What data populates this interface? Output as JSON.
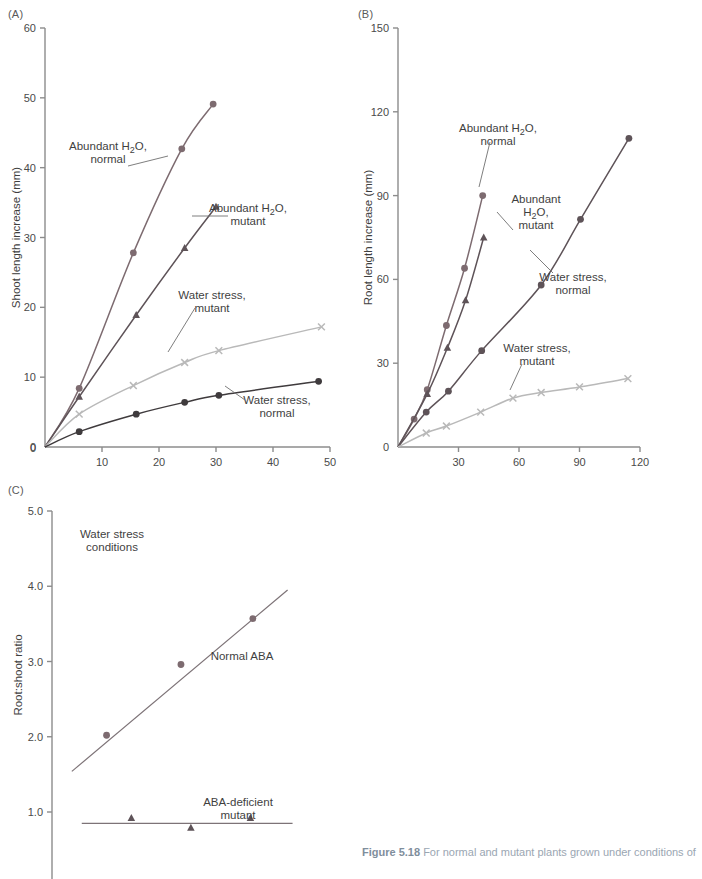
{
  "figure": {
    "caption_label": "Figure 5.18",
    "caption_text": "For normal and mutant plants grown under conditions of"
  },
  "panels": {
    "a": {
      "letter": "(A)",
      "xlabel": "Hours after transplanting",
      "ylabel": "Shoot length increase (mm)",
      "xticks": [
        "0",
        "10",
        "20",
        "30",
        "40",
        "50"
      ],
      "yticks": [
        "0",
        "10",
        "20",
        "30",
        "40",
        "50",
        "60"
      ],
      "labels": {
        "abundant_normal": [
          "Abundant H₂O,",
          "normal"
        ],
        "abundant_mutant": [
          "Abundant H₂O,",
          "mutant"
        ],
        "stress_mutant": [
          "Water stress,",
          "mutant"
        ],
        "stress_normal": [
          "Water stress,",
          "normal"
        ]
      }
    },
    "b": {
      "letter": "(B)",
      "xlabel": "Hours after transplanting",
      "ylabel": "Root length increase (mm)",
      "xticks": [
        "0",
        "30",
        "60",
        "90",
        "120"
      ],
      "yticks": [
        "0",
        "30",
        "60",
        "90",
        "120",
        "150"
      ],
      "labels": {
        "abundant_normal": [
          "Abundant H₂O,",
          "normal"
        ],
        "abundant_mutant": [
          "Abundant",
          "H₂O,",
          "mutant"
        ],
        "stress_normal": [
          "Water stress,",
          "normal"
        ],
        "stress_mutant": [
          "Water stress,",
          "mutant"
        ]
      }
    },
    "c": {
      "letter": "(C)",
      "ylabel": "Root:shoot ratio",
      "yticks": [
        "1.0",
        "2.0",
        "3.0",
        "4.0",
        "5.0"
      ],
      "labels": {
        "conditions": [
          "Water stress",
          "conditions"
        ],
        "normal_aba": "Normal ABA",
        "aba_deficient": [
          "ABA-deficient",
          "mutant"
        ]
      }
    }
  },
  "colors": {
    "axis": "#8c8c8c",
    "text": "#3f3f3f",
    "abundant_normal": "#7d6b70",
    "abundant_mutant": "#5e5358",
    "stress_normal": "#3f3b3d",
    "stress_mutant": "#b9b9b9",
    "panel_c_line": "#7d7377",
    "caption": "#9aa6b2"
  },
  "chart_data": [
    {
      "id": "panel-a",
      "type": "line",
      "title": "(A)",
      "xlabel": "Hours after transplanting",
      "ylabel": "Shoot length increase (mm)",
      "xlim": [
        0,
        50
      ],
      "ylim": [
        0,
        60
      ],
      "xticks": [
        0,
        10,
        20,
        30,
        40,
        50
      ],
      "yticks": [
        0,
        10,
        20,
        30,
        40,
        50,
        60
      ],
      "grid": false,
      "legend": "inline-annotations",
      "series": [
        {
          "name": "Abundant H2O, normal",
          "marker": "circle",
          "color": "#7d6b70",
          "x": [
            0,
            6,
            15.5,
            24,
            29.5
          ],
          "y": [
            0,
            8.4,
            27.8,
            42.7,
            49.1
          ]
        },
        {
          "name": "Abundant H2O, mutant",
          "marker": "triangle",
          "color": "#5e5358",
          "x": [
            0,
            6,
            16,
            24.5,
            30
          ],
          "y": [
            0,
            7.2,
            18.9,
            28.5,
            34.4
          ]
        },
        {
          "name": "Water stress, mutant",
          "marker": "cross",
          "color": "#b9b9b9",
          "x": [
            0,
            6,
            15.5,
            24.5,
            30.5,
            48.5
          ],
          "y": [
            0,
            4.7,
            8.8,
            12.1,
            13.8,
            17.2
          ]
        },
        {
          "name": "Water stress, normal",
          "marker": "circle",
          "color": "#3f3b3d",
          "x": [
            0,
            6,
            16,
            24.5,
            30.5,
            48
          ],
          "y": [
            0,
            2.2,
            4.7,
            6.4,
            7.4,
            9.4
          ]
        }
      ]
    },
    {
      "id": "panel-b",
      "type": "line",
      "title": "(B)",
      "xlabel": "Hours after transplanting",
      "ylabel": "Root length increase (mm)",
      "xlim": [
        0,
        120
      ],
      "ylim": [
        0,
        150
      ],
      "xticks": [
        0,
        30,
        60,
        90,
        120
      ],
      "yticks": [
        0,
        30,
        60,
        90,
        120,
        150
      ],
      "grid": false,
      "legend": "inline-annotations",
      "series": [
        {
          "name": "Abundant H2O, normal",
          "marker": "circle",
          "color": "#7d6b70",
          "x": [
            0,
            8,
            14.5,
            24,
            33,
            42
          ],
          "y": [
            0,
            10,
            20.5,
            43.5,
            64,
            90
          ]
        },
        {
          "name": "Abundant H2O, mutant",
          "marker": "triangle",
          "color": "#5e5358",
          "x": [
            0,
            14.5,
            24.5,
            33.5,
            42.5
          ],
          "y": [
            0,
            19,
            35.5,
            52.5,
            75
          ]
        },
        {
          "name": "Water stress, normal",
          "marker": "circle",
          "color": "#5e5358",
          "x": [
            0,
            14,
            25,
            41.5,
            71,
            90.5,
            114.5
          ],
          "y": [
            0,
            12.5,
            20,
            34.5,
            58,
            81.5,
            110.5
          ]
        },
        {
          "name": "Water stress, mutant",
          "marker": "cross",
          "color": "#b9b9b9",
          "x": [
            0,
            14,
            24,
            41,
            57,
            71,
            90,
            114
          ],
          "y": [
            0,
            5,
            7.5,
            12.5,
            17.5,
            19.5,
            21.5,
            24.5
          ]
        }
      ]
    },
    {
      "id": "panel-c",
      "type": "scatter",
      "title": "(C)",
      "ylabel": "Root:shoot ratio",
      "ylim": [
        0.6,
        5.0
      ],
      "yticks": [
        1.0,
        2.0,
        3.0,
        4.0,
        5.0
      ],
      "grid": false,
      "annotations": [
        "Water stress conditions",
        "Normal ABA",
        "ABA-deficient mutant"
      ],
      "series": [
        {
          "name": "Normal ABA",
          "marker": "circle",
          "color": "#7d6b70",
          "x": [
            0.22,
            0.52,
            0.81
          ],
          "y": [
            2.02,
            2.96,
            3.57
          ],
          "fit": {
            "x": [
              0.08,
              0.95
            ],
            "y": [
              1.54,
              3.95
            ]
          }
        },
        {
          "name": "ABA-deficient mutant",
          "marker": "triangle",
          "color": "#5e5358",
          "x": [
            0.32,
            0.56,
            0.8
          ],
          "y": [
            0.92,
            0.79,
            0.92
          ],
          "fit": {
            "x": [
              0.12,
              0.97
            ],
            "y": [
              0.85,
              0.85
            ]
          }
        }
      ]
    }
  ]
}
